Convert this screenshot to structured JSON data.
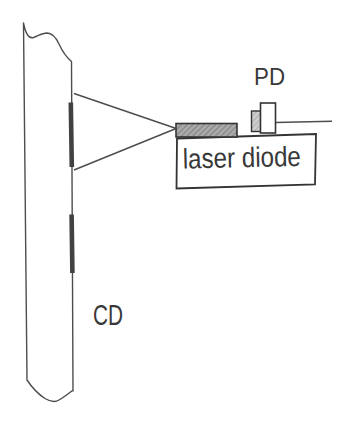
{
  "diagram": {
    "type": "schematic",
    "labels": {
      "disc": "CD",
      "photodiode": "PD",
      "laser": "laser diode"
    },
    "colors": {
      "background": "#ffffff",
      "line": "#4d4d4d",
      "border": "#333333",
      "text": "#383838",
      "chip_fill": "#a9a9a9",
      "chip_hatch": "#6f6f6f",
      "pd_window_fill": "#cdcdcd",
      "pd_window_hatch": "#9d9d9d",
      "pit_bar": "#414141"
    }
  }
}
